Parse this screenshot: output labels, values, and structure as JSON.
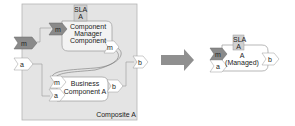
{
  "left": {
    "composite_label": "Composite A",
    "manager": {
      "sla": "SLA",
      "sla_sub": "A",
      "line1": "Component",
      "line2": "Manager",
      "line3": "Component",
      "port_in": "m",
      "port_out": "m"
    },
    "business": {
      "line1": "Business",
      "line2": "Component A",
      "port_m": "m",
      "port_a": "a",
      "port_b": "b"
    },
    "composite_ports": {
      "m": "m",
      "a": "a",
      "b": "b"
    }
  },
  "right": {
    "sla": "SLA",
    "sla_sub": "A",
    "line1": "A",
    "line2": "(Managed)",
    "port_m": "m",
    "port_a": "a",
    "port_b": "b"
  },
  "colors": {
    "composite_bg": "#e4e4e4",
    "manager_bg": "#f0f0f0",
    "dark_port": "#8a8a8a",
    "arrow": "#8f8f8f"
  }
}
